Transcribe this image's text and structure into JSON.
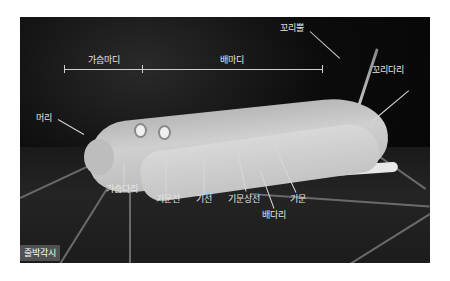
{
  "figure": {
    "species_label": "줄박각시",
    "segments": {
      "thorax": "가슴마디",
      "abdomen": "배마디"
    },
    "parts": {
      "head": "머리",
      "thoracic_legs": "가슴다리",
      "tail_horn": "꼬리뿔",
      "anal_prolegs": "꼬리다리",
      "subspiracular_line": "기문선",
      "base_line": "기선",
      "supraspiracular_line": "기문상선",
      "spiracle": "기문",
      "prolegs": "배다리"
    }
  }
}
